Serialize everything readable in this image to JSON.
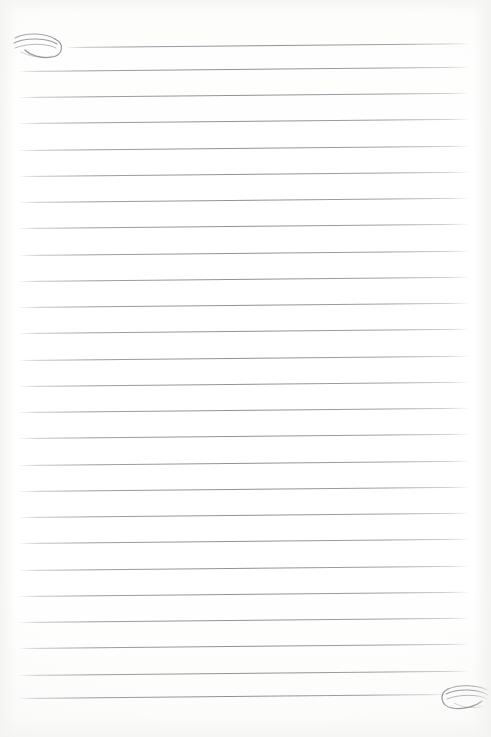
{
  "document": {
    "type": "lined-notebook-page",
    "title": "Blank ruled writing page",
    "page_width": 491,
    "page_height": 737,
    "background_color": "#fefefe",
    "paper_tint": "#fcfcfb",
    "body_text": "",
    "content_note": "Page is blank — ruled guide lines only, no handwriting or printed text."
  },
  "ruling": {
    "line_color": "#909096",
    "line_thickness_px": 1,
    "line_count": 26,
    "first_line_y": 47,
    "line_spacing_px": 26.6,
    "left_margin_x": 20,
    "right_margin_x": 468,
    "skew_degrees": -0.55,
    "lines": [
      {
        "index": 1,
        "y": 47,
        "x1": 67,
        "x2": 468
      },
      {
        "index": 2,
        "y": 71,
        "x1": 20,
        "x2": 468
      },
      {
        "index": 3,
        "y": 97,
        "x1": 20,
        "x2": 468
      },
      {
        "index": 4,
        "y": 123,
        "x1": 20,
        "x2": 468
      },
      {
        "index": 5,
        "y": 150,
        "x1": 20,
        "x2": 468
      },
      {
        "index": 6,
        "y": 176,
        "x1": 20,
        "x2": 468
      },
      {
        "index": 7,
        "y": 202,
        "x1": 20,
        "x2": 468
      },
      {
        "index": 8,
        "y": 228,
        "x1": 20,
        "x2": 468
      },
      {
        "index": 9,
        "y": 255,
        "x1": 20,
        "x2": 468
      },
      {
        "index": 10,
        "y": 281,
        "x1": 20,
        "x2": 468
      },
      {
        "index": 11,
        "y": 307,
        "x1": 20,
        "x2": 468
      },
      {
        "index": 12,
        "y": 333,
        "x1": 20,
        "x2": 468
      },
      {
        "index": 13,
        "y": 360,
        "x1": 20,
        "x2": 468
      },
      {
        "index": 14,
        "y": 386,
        "x1": 20,
        "x2": 468
      },
      {
        "index": 15,
        "y": 412,
        "x1": 20,
        "x2": 468
      },
      {
        "index": 16,
        "y": 438,
        "x1": 20,
        "x2": 468
      },
      {
        "index": 17,
        "y": 465,
        "x1": 20,
        "x2": 468
      },
      {
        "index": 18,
        "y": 491,
        "x1": 20,
        "x2": 468
      },
      {
        "index": 19,
        "y": 517,
        "x1": 20,
        "x2": 468
      },
      {
        "index": 20,
        "y": 543,
        "x1": 20,
        "x2": 468
      },
      {
        "index": 21,
        "y": 570,
        "x1": 20,
        "x2": 468
      },
      {
        "index": 22,
        "y": 596,
        "x1": 20,
        "x2": 468
      },
      {
        "index": 23,
        "y": 622,
        "x1": 20,
        "x2": 468
      },
      {
        "index": 24,
        "y": 648,
        "x1": 20,
        "x2": 468
      },
      {
        "index": 25,
        "y": 675,
        "x1": 20,
        "x2": 468
      },
      {
        "index": 26,
        "y": 698,
        "x1": 20,
        "x2": 445
      }
    ]
  },
  "ornaments": {
    "color": "#8d8d95",
    "top_left": {
      "name": "swirl-flourish",
      "x": 12,
      "y": 30,
      "width": 52,
      "height": 30,
      "description": "Nested calligraphic swirl terminating the start of the first ruled line"
    },
    "bottom_right": {
      "name": "swirl-flourish",
      "x": 438,
      "y": 682,
      "width": 48,
      "height": 28,
      "description": "Mirrored calligraphic swirl terminating the end of the last ruled line"
    }
  }
}
